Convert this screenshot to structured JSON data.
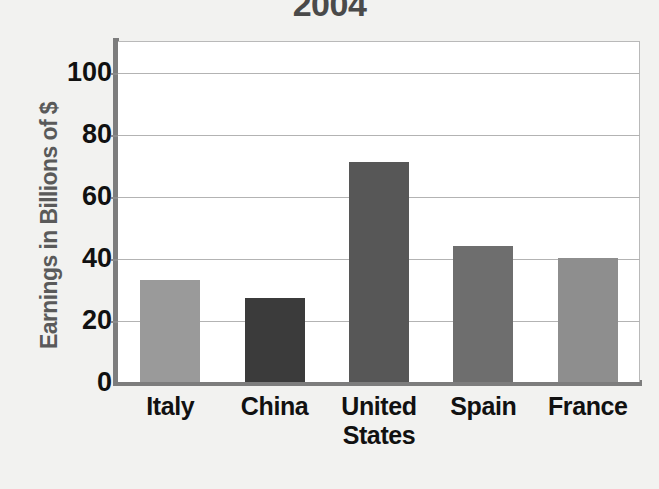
{
  "chart_data": {
    "type": "bar",
    "title": "2004",
    "xlabel": "",
    "ylabel": "Earnings in Billions of $",
    "categories": [
      "Italy",
      "China",
      "United States",
      "Spain",
      "France"
    ],
    "values": [
      33,
      27,
      71,
      44,
      40
    ],
    "ylim": [
      0,
      110
    ],
    "yticks": [
      0,
      20,
      40,
      60,
      80,
      100
    ],
    "ytick_labels": [
      "0",
      "20",
      "40",
      "60",
      "80",
      "100"
    ],
    "grid": true,
    "legend": "none",
    "bar_colors": [
      "#9a9a9a",
      "#3b3b3b",
      "#575757",
      "#6e6e6e",
      "#8e8e8e"
    ],
    "plot_background": "#ffffff",
    "axis_color": "#7d7d7d",
    "gridline_color": "#b3b3b3",
    "page_background": "#f2f2f0",
    "title_color": "#4a4a4a",
    "ylabel_color": "#5a5a5a",
    "tick_label_color": "#111111"
  }
}
